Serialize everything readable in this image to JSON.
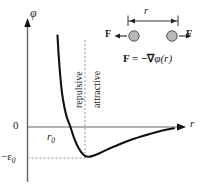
{
  "chart_data": {
    "type": "line",
    "title": "",
    "subtitle": "",
    "xlabel": "r",
    "ylabel": "φ",
    "xlim": [
      0,
      204
    ],
    "ylim": [
      -1.25,
      3.0
    ],
    "grid": false,
    "legend": null,
    "axes": {
      "y_axis_label": "φ",
      "x_axis_label": "r",
      "y_ticks": [
        {
          "label": "0",
          "value": 0
        },
        {
          "label": "−ε",
          "sub": "0",
          "value": -1
        }
      ],
      "x_ticks": [
        {
          "label": "r",
          "sub": "0",
          "value": 53
        }
      ]
    },
    "annotations": [
      {
        "name": "repulsive-region",
        "text": "repulsive",
        "orientation": "vertical"
      },
      {
        "name": "attractive-region",
        "text": "attractive",
        "orientation": "vertical"
      }
    ],
    "series": [
      {
        "name": "pair-potential",
        "x": [
          57.5,
          58.5,
          60,
          62,
          64.5,
          67,
          70,
          73.5,
          77,
          81,
          85,
          89,
          94,
          100,
          107,
          115,
          124,
          134,
          145,
          156,
          166,
          174
        ],
        "y": [
          2.95,
          2.4,
          1.75,
          1.1,
          0.62,
          0.3,
          0.04,
          -0.3,
          -0.58,
          -0.8,
          -0.93,
          -0.96,
          -0.92,
          -0.84,
          -0.73,
          -0.62,
          -0.5,
          -0.38,
          -0.27,
          -0.17,
          -0.09,
          -0.04
        ]
      }
    ],
    "markers": {
      "zero_crossing_x": 53,
      "minimum_x": 85,
      "minimum_y": -1.0
    }
  },
  "inset": {
    "name": "force-diagram",
    "separation_label": "r",
    "left_force_label": "F",
    "right_force_label": "F",
    "formula": {
      "lhs": "F",
      "operator": " = −∇",
      "potential": "φ(r)"
    },
    "particles": [
      {
        "name": "particle-left"
      },
      {
        "name": "particle-right"
      }
    ]
  },
  "colors": {
    "curve": "#111111",
    "axis": "#555555",
    "dashed": "#777777",
    "particle_fill": "#b8b8b8",
    "particle_stroke": "#555555",
    "background": "#ffffff"
  }
}
